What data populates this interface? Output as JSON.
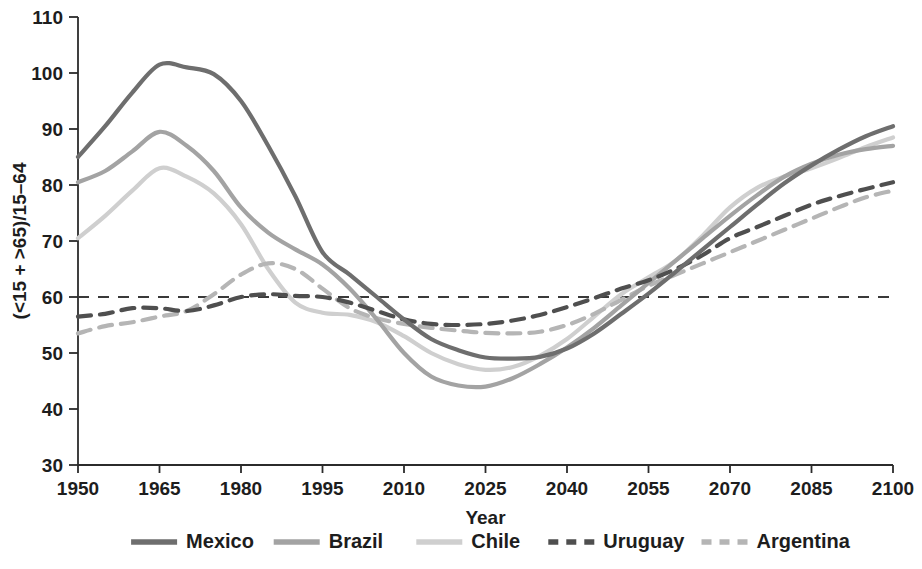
{
  "chart_data": {
    "type": "line",
    "title": "",
    "xlabel": "Year",
    "ylabel": "(<15 + >65)/15–64",
    "xlim": [
      1950,
      2100
    ],
    "ylim": [
      30,
      110
    ],
    "grid": false,
    "legend_position": "bottom",
    "xticks": [
      "1950",
      "1965",
      "1980",
      "1995",
      "2010",
      "2025",
      "2040",
      "2055",
      "2070",
      "2085",
      "2100"
    ],
    "yticks": [
      "30",
      "40",
      "50",
      "60",
      "70",
      "80",
      "90",
      "100",
      "110"
    ],
    "reference_line": {
      "label": "60",
      "value": 60,
      "style": "dashed",
      "color": "#3a3a3a"
    },
    "x": [
      1950,
      1955,
      1960,
      1965,
      1970,
      1975,
      1980,
      1985,
      1990,
      1995,
      2000,
      2005,
      2010,
      2015,
      2020,
      2025,
      2030,
      2035,
      2040,
      2045,
      2050,
      2055,
      2060,
      2065,
      2070,
      2075,
      2080,
      2085,
      2090,
      2095,
      2100
    ],
    "series": [
      {
        "name": "Mexico",
        "color": "#6e6e6e",
        "style": "solid",
        "width": 4.2,
        "values": [
          85.0,
          90.5,
          96.5,
          101.5,
          101.0,
          99.8,
          95.0,
          87.0,
          78.0,
          68.0,
          64.0,
          60.0,
          56.0,
          52.5,
          50.5,
          49.2,
          49.0,
          49.3,
          50.8,
          53.5,
          57.0,
          60.6,
          64.5,
          68.5,
          72.5,
          76.5,
          80.3,
          83.5,
          86.3,
          88.7,
          90.5
        ]
      },
      {
        "name": "Brazil",
        "color": "#a3a3a3",
        "style": "solid",
        "width": 4.2,
        "values": [
          80.5,
          82.5,
          86.0,
          89.5,
          87.0,
          82.5,
          76.0,
          71.5,
          68.5,
          65.8,
          61.5,
          56.0,
          50.0,
          45.8,
          44.2,
          44.0,
          45.5,
          48.0,
          51.0,
          54.5,
          58.5,
          62.5,
          66.5,
          70.5,
          74.5,
          78.2,
          81.5,
          83.8,
          85.4,
          86.4,
          87.0
        ]
      },
      {
        "name": "Chile",
        "color": "#cfcfcf",
        "style": "solid",
        "width": 4.2,
        "values": [
          70.5,
          74.5,
          79.0,
          83.0,
          81.5,
          78.5,
          73.0,
          65.0,
          59.0,
          57.2,
          56.8,
          55.5,
          53.0,
          50.0,
          48.0,
          47.0,
          47.5,
          49.5,
          52.5,
          56.5,
          60.5,
          63.5,
          66.5,
          71.0,
          76.0,
          79.5,
          81.5,
          83.0,
          84.8,
          86.8,
          88.5
        ]
      },
      {
        "name": "Uruguay",
        "color": "#4f4f4f",
        "style": "dashed",
        "width": 4.2,
        "values": [
          56.5,
          57.0,
          58.0,
          58.0,
          57.5,
          58.5,
          60.0,
          60.5,
          60.2,
          60.0,
          59.0,
          57.5,
          56.0,
          55.2,
          55.0,
          55.2,
          55.8,
          56.8,
          58.2,
          59.8,
          61.5,
          63.0,
          65.0,
          67.5,
          70.5,
          72.5,
          74.5,
          76.5,
          78.0,
          79.3,
          80.5
        ]
      },
      {
        "name": "Argentina",
        "color": "#b5b5b5",
        "style": "dashed",
        "width": 4.2,
        "values": [
          53.5,
          54.8,
          55.5,
          56.5,
          57.5,
          60.5,
          64.0,
          66.0,
          65.0,
          61.5,
          58.0,
          56.2,
          55.2,
          54.5,
          54.0,
          53.6,
          53.5,
          53.8,
          55.0,
          57.0,
          59.5,
          62.0,
          64.0,
          66.0,
          68.0,
          70.0,
          72.0,
          74.0,
          76.0,
          77.8,
          79.0
        ]
      }
    ]
  },
  "legend": {
    "items": [
      {
        "label": "Mexico",
        "color": "#6e6e6e",
        "style": "solid"
      },
      {
        "label": "Brazil",
        "color": "#a3a3a3",
        "style": "solid"
      },
      {
        "label": "Chile",
        "color": "#cfcfcf",
        "style": "solid"
      },
      {
        "label": "Uruguay",
        "color": "#4f4f4f",
        "style": "dashed"
      },
      {
        "label": "Argentina",
        "color": "#b5b5b5",
        "style": "dashed"
      }
    ]
  }
}
